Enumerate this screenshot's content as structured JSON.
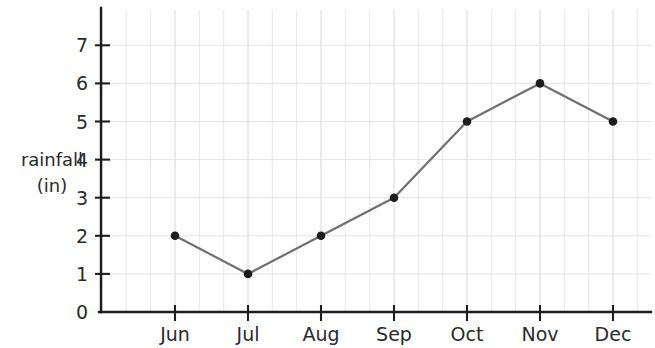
{
  "chart_data": {
    "type": "line",
    "title": "",
    "xlabel": "",
    "ylabel": "rainfall (in)",
    "ylabel_line1": "rainfall",
    "ylabel_line2": "(in)",
    "categories": [
      "Jun",
      "Jul",
      "Aug",
      "Sep",
      "Oct",
      "Nov",
      "Dec"
    ],
    "values": [
      2,
      1,
      2,
      3,
      5,
      6,
      5
    ],
    "series": [
      {
        "name": "rainfall",
        "values": [
          2,
          1,
          2,
          3,
          5,
          6,
          5
        ]
      }
    ],
    "ylim": [
      0,
      7.6
    ],
    "y_ticks": [
      0,
      1,
      2,
      3,
      4,
      5,
      6,
      7
    ],
    "y_tick_labels": [
      "0",
      "1",
      "2",
      "3",
      "4",
      "5",
      "6",
      "7"
    ],
    "grid": true,
    "grid_minor_per_interval": 2,
    "legend": "none",
    "colors": {
      "line": "#6f6f6f",
      "marker": "#1d1d1d",
      "axis": "#1e1e1e",
      "grid_major": "#d6d6d6",
      "grid_minor": "#e8e8e8",
      "background": "#ffffff",
      "text": "#2a2a2a"
    }
  }
}
